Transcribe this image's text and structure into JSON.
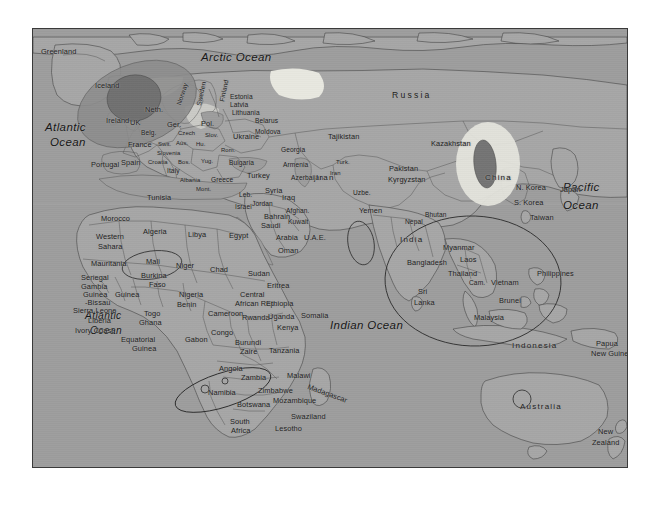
{
  "figure": {
    "type": "world-map",
    "frame": {
      "x": 32,
      "y": 28,
      "width": 594,
      "height": 438
    },
    "colors": {
      "background": "#ffffff",
      "map_fill": "#9d9d9d",
      "ocean": "#9d9d9d",
      "land": "#a8a8a8",
      "coastline": "#3c3c3c",
      "border": "#555555",
      "highlight_light": "#e8e8e0",
      "highlight_mid": "#8f8f8f",
      "highlight_dark": "#707070",
      "label": "#1d1d1d",
      "frame_stroke": "#3a3a3a"
    }
  },
  "oceans": [
    {
      "name": "Arctic Ocean",
      "x": 168,
      "y": 23,
      "size": "lg"
    },
    {
      "name": "Atlantic",
      "x": 12,
      "y": 93,
      "size": "lg"
    },
    {
      "name": "Ocean",
      "x": 17,
      "y": 108,
      "size": "lg"
    },
    {
      "name": "Atlantic",
      "x": 52,
      "y": 282,
      "size": "sm"
    },
    {
      "name": "Ocean",
      "x": 57,
      "y": 297,
      "size": "sm"
    },
    {
      "name": "Pacific",
      "x": 530,
      "y": 153,
      "size": "lg"
    },
    {
      "name": "Ocean",
      "x": 530,
      "y": 171,
      "size": "lg"
    },
    {
      "name": "Indian   Ocean",
      "x": 297,
      "y": 291,
      "size": "lg"
    }
  ],
  "regions": {
    "north_atlantic": [
      {
        "name": "Greenland",
        "x": 8,
        "y": 19
      },
      {
        "name": "Iceland",
        "x": 62,
        "y": 53
      },
      {
        "name": "Ireland",
        "x": 73,
        "y": 88
      }
    ],
    "europe": [
      {
        "name": "Norway",
        "x": 143,
        "y": 75,
        "rot": "rot-70"
      },
      {
        "name": "Sweden",
        "x": 163,
        "y": 76,
        "rot": "rot-75"
      },
      {
        "name": "Finland",
        "x": 186,
        "y": 72,
        "rot": "rot-75"
      },
      {
        "name": "Estonia",
        "x": 197,
        "y": 65
      },
      {
        "name": "Latvia",
        "x": 197,
        "y": 73
      },
      {
        "name": "Lithuania",
        "x": 199,
        "y": 81
      },
      {
        "name": "Belarus",
        "x": 222,
        "y": 89
      },
      {
        "name": "Neth.",
        "x": 112,
        "y": 77
      },
      {
        "name": "UK",
        "x": 97,
        "y": 90
      },
      {
        "name": "Ger.",
        "x": 134,
        "y": 92
      },
      {
        "name": "Pol.",
        "x": 168,
        "y": 91
      },
      {
        "name": "Belg.",
        "x": 108,
        "y": 101
      },
      {
        "name": "Czech",
        "x": 145,
        "y": 101
      },
      {
        "name": "Slov.",
        "x": 172,
        "y": 103
      },
      {
        "name": "Ukraine",
        "x": 200,
        "y": 104
      },
      {
        "name": "France",
        "x": 95,
        "y": 112
      },
      {
        "name": "Swit.",
        "x": 125,
        "y": 112
      },
      {
        "name": "Aus.",
        "x": 143,
        "y": 111
      },
      {
        "name": "Hu.",
        "x": 163,
        "y": 112
      },
      {
        "name": "Moldova",
        "x": 222,
        "y": 100
      },
      {
        "name": "Slovenia",
        "x": 124,
        "y": 121
      },
      {
        "name": "Rom.",
        "x": 188,
        "y": 118
      },
      {
        "name": "Croatia",
        "x": 115,
        "y": 130
      },
      {
        "name": "Bos.",
        "x": 145,
        "y": 130
      },
      {
        "name": "Yug.",
        "x": 168,
        "y": 129
      },
      {
        "name": "Bulgaria",
        "x": 196,
        "y": 131
      },
      {
        "name": "Georgia",
        "x": 248,
        "y": 118
      },
      {
        "name": "Armenia",
        "x": 250,
        "y": 133
      },
      {
        "name": "Italy",
        "x": 134,
        "y": 139
      },
      {
        "name": "Albania",
        "x": 147,
        "y": 148
      },
      {
        "name": "Greece",
        "x": 178,
        "y": 148
      },
      {
        "name": "Turkey",
        "x": 214,
        "y": 143
      },
      {
        "name": "Mont.",
        "x": 163,
        "y": 157
      },
      {
        "name": "Portugal",
        "x": 58,
        "y": 132
      },
      {
        "name": "Spain",
        "x": 88,
        "y": 130
      },
      {
        "name": "Azerbaijan",
        "x": 258,
        "y": 146
      }
    ],
    "middle_east": [
      {
        "name": "Tunisia",
        "x": 114,
        "y": 165
      },
      {
        "name": "Leb.",
        "x": 206,
        "y": 163
      },
      {
        "name": "Syria",
        "x": 232,
        "y": 158
      },
      {
        "name": "Israel",
        "x": 202,
        "y": 175
      },
      {
        "name": "Jordan",
        "x": 219,
        "y": 172
      },
      {
        "name": "Iraq",
        "x": 249,
        "y": 165
      },
      {
        "name": "Iran",
        "x": 283,
        "y": 161
      },
      {
        "name": "Turk.",
        "x": 297,
        "y": 141
      },
      {
        "name": "Uzbe.",
        "x": 303,
        "y": 130
      },
      {
        "name": "Afghan.",
        "x": 320,
        "y": 161
      },
      {
        "name": "Kuwait",
        "x": 253,
        "y": 179
      },
      {
        "name": "Bahrain",
        "x": 255,
        "y": 190
      },
      {
        "name": "Saudi",
        "x": 231,
        "y": 184
      },
      {
        "name": "Arabia",
        "x": 228,
        "y": 193
      },
      {
        "name": "U.A.E.",
        "x": 243,
        "y": 205
      },
      {
        "name": "Oman",
        "x": 271,
        "y": 205
      },
      {
        "name": "Yemen",
        "x": 245,
        "y": 218
      },
      {
        "name": "Pakistan",
        "x": 326,
        "y": 178
      },
      {
        "name": "Kyrgyzstan",
        "x": 356,
        "y": 136
      },
      {
        "name": "Tajikistan",
        "x": 355,
        "y": 147
      },
      {
        "name": "Kazakhstan",
        "x": 295,
        "y": 104
      },
      {
        "name": "Mongolia",
        "x": 398,
        "y": 111
      }
    ],
    "russia_asia": [
      {
        "name": "Russia",
        "x": 359,
        "y": 62,
        "style": "big"
      },
      {
        "name": "China",
        "x": 452,
        "y": 145,
        "style": "mid"
      },
      {
        "name": "Iran",
        "x": 283,
        "y": 145,
        "style": "mid"
      }
    ],
    "south_asia": [
      {
        "name": "Nepal",
        "x": 372,
        "y": 190
      },
      {
        "name": "Bhutan",
        "x": 392,
        "y": 183
      },
      {
        "name": "India",
        "x": 367,
        "y": 207,
        "style": "mid"
      },
      {
        "name": "Bangladesh",
        "x": 374,
        "y": 230
      },
      {
        "name": "Myanmar",
        "x": 410,
        "y": 215
      },
      {
        "name": "Sri",
        "x": 385,
        "y": 259
      },
      {
        "name": "Lanka",
        "x": 381,
        "y": 270
      },
      {
        "name": "Laos",
        "x": 427,
        "y": 227
      },
      {
        "name": "Thailand",
        "x": 415,
        "y": 241
      },
      {
        "name": "Cam.",
        "x": 436,
        "y": 251
      },
      {
        "name": "Vietnam",
        "x": 458,
        "y": 250
      },
      {
        "name": "Brunei",
        "x": 466,
        "y": 268
      },
      {
        "name": "Malaysia",
        "x": 441,
        "y": 285
      },
      {
        "name": "Philippines",
        "x": 504,
        "y": 241
      },
      {
        "name": "Indonesia",
        "x": 479,
        "y": 313,
        "style": "mid"
      },
      {
        "name": "Papua",
        "x": 563,
        "y": 311
      },
      {
        "name": "New Guinea",
        "x": 558,
        "y": 321
      },
      {
        "name": "Taiwan",
        "x": 497,
        "y": 185
      },
      {
        "name": "Japan",
        "x": 527,
        "y": 157
      },
      {
        "name": "N. Korea",
        "x": 483,
        "y": 155
      },
      {
        "name": "S. Korea",
        "x": 481,
        "y": 170
      }
    ],
    "africa": [
      {
        "name": "Morocco",
        "x": 68,
        "y": 186
      },
      {
        "name": "Western",
        "x": 63,
        "y": 204
      },
      {
        "name": "Sahara",
        "x": 65,
        "y": 214
      },
      {
        "name": "Algeria",
        "x": 110,
        "y": 199
      },
      {
        "name": "Libya",
        "x": 155,
        "y": 202
      },
      {
        "name": "Egypt",
        "x": 196,
        "y": 203
      },
      {
        "name": "Mauritania",
        "x": 58,
        "y": 231
      },
      {
        "name": "Mali",
        "x": 113,
        "y": 229
      },
      {
        "name": "Niger",
        "x": 143,
        "y": 233
      },
      {
        "name": "Chad",
        "x": 177,
        "y": 237
      },
      {
        "name": "Sudan",
        "x": 215,
        "y": 241
      },
      {
        "name": "Eritrea",
        "x": 234,
        "y": 253
      },
      {
        "name": "Senegal",
        "x": 48,
        "y": 245
      },
      {
        "name": "Gambia",
        "x": 48,
        "y": 254
      },
      {
        "name": "Guinea",
        "x": 50,
        "y": 262
      },
      {
        "name": "-Bissau",
        "x": 52,
        "y": 270
      },
      {
        "name": "Burkina",
        "x": 108,
        "y": 243
      },
      {
        "name": "Faso",
        "x": 116,
        "y": 252
      },
      {
        "name": "Guinea",
        "x": 82,
        "y": 262
      },
      {
        "name": "Nigeria",
        "x": 146,
        "y": 262
      },
      {
        "name": "Benin",
        "x": 144,
        "y": 272
      },
      {
        "name": "Sierra Leone",
        "x": 40,
        "y": 278
      },
      {
        "name": "Liberia",
        "x": 55,
        "y": 288
      },
      {
        "name": "Ivory Coast",
        "x": 42,
        "y": 298
      },
      {
        "name": "Ghana",
        "x": 106,
        "y": 290
      },
      {
        "name": "Togo",
        "x": 111,
        "y": 281
      },
      {
        "name": "Cameroon",
        "x": 175,
        "y": 281
      },
      {
        "name": "Central",
        "x": 207,
        "y": 262
      },
      {
        "name": "African Rep.",
        "x": 202,
        "y": 271
      },
      {
        "name": "Ethiopia",
        "x": 233,
        "y": 271
      },
      {
        "name": "Equatorial",
        "x": 88,
        "y": 307
      },
      {
        "name": "Guinea",
        "x": 99,
        "y": 316
      },
      {
        "name": "Gabon",
        "x": 152,
        "y": 307
      },
      {
        "name": "Congo",
        "x": 178,
        "y": 300
      },
      {
        "name": "Rwanda",
        "x": 209,
        "y": 285
      },
      {
        "name": "Uganda",
        "x": 235,
        "y": 284
      },
      {
        "name": "Somalia",
        "x": 268,
        "y": 283
      },
      {
        "name": "Kenya",
        "x": 244,
        "y": 295
      },
      {
        "name": "Burundi",
        "x": 202,
        "y": 310
      },
      {
        "name": "Zaire",
        "x": 207,
        "y": 319
      },
      {
        "name": "Tanzania",
        "x": 236,
        "y": 318
      },
      {
        "name": "Angola",
        "x": 186,
        "y": 336
      },
      {
        "name": "Zambia",
        "x": 208,
        "y": 345
      },
      {
        "name": "Malawi",
        "x": 254,
        "y": 343
      },
      {
        "name": "Madagascar",
        "x": 276,
        "y": 354,
        "rot": "rot20"
      },
      {
        "name": "Namibia",
        "x": 175,
        "y": 360
      },
      {
        "name": "Zimbabwe",
        "x": 225,
        "y": 358
      },
      {
        "name": "Botswana",
        "x": 204,
        "y": 372
      },
      {
        "name": "Mozambique",
        "x": 240,
        "y": 368
      },
      {
        "name": "South",
        "x": 197,
        "y": 389
      },
      {
        "name": "Africa",
        "x": 198,
        "y": 398
      },
      {
        "name": "Swaziland",
        "x": 258,
        "y": 384
      },
      {
        "name": "Lesotho",
        "x": 242,
        "y": 396
      }
    ],
    "oceania": [
      {
        "name": "Australia",
        "x": 487,
        "y": 374,
        "style": "mid"
      },
      {
        "name": "New",
        "x": 565,
        "y": 399
      },
      {
        "name": "Zealand",
        "x": 559,
        "y": 410
      }
    ]
  },
  "highlights": [
    {
      "name": "europe-outer-ellipse",
      "cx": 136,
      "cy": 103,
      "rx": 62,
      "ry": 40,
      "rotate": -22,
      "fill": "#8f8f8f"
    },
    {
      "name": "europe-inner-ellipse",
      "cx": 133,
      "cy": 97,
      "rx": 27,
      "ry": 23,
      "rotate": -10,
      "fill": "#737373"
    },
    {
      "name": "korea-light-ellipse",
      "cx": 486,
      "cy": 163,
      "rx": 32,
      "ry": 42,
      "rotate": 0,
      "fill": "#e4e4dc"
    },
    {
      "name": "korea-dark-ellipse",
      "cx": 483,
      "cy": 163,
      "rx": 11,
      "ry": 24,
      "rotate": -6,
      "fill": "#6f6f6f"
    },
    {
      "name": "southeast-asia-ellipse",
      "cx": 471,
      "cy": 280,
      "rx": 88,
      "ry": 65,
      "rotate": 2,
      "fill": "none"
    },
    {
      "name": "south-africa-ellipse",
      "cx": 221,
      "cy": 389,
      "rx": 50,
      "ry": 17,
      "rotate": -18,
      "fill": "none"
    },
    {
      "name": "india-ellipse",
      "cx": 359,
      "cy": 242,
      "rx": 13,
      "ry": 22,
      "rotate": -10,
      "fill": "none"
    },
    {
      "name": "australia-circle",
      "cx": 520,
      "cy": 398,
      "rx": 9,
      "ry": 9,
      "rotate": 0,
      "fill": "none"
    },
    {
      "name": "nigeria-ellipse",
      "cx": 150,
      "cy": 264,
      "rx": 30,
      "ry": 14,
      "rotate": -8,
      "fill": "none"
    }
  ]
}
